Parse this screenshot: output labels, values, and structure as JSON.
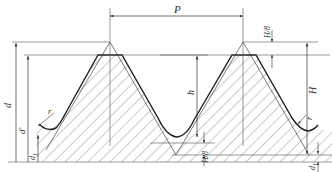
{
  "figure": {
    "type": "thread-profile-drawing",
    "labels": {
      "pitch": "P",
      "major_diameter": "d",
      "diameter_prime": "d'",
      "minor_diameter": "d",
      "minor_diameter_sub": "1",
      "thread_depth": "h",
      "fundamental_height": "H",
      "crest_truncation": "H/8",
      "root_truncation": "H/8",
      "radius_left": "r",
      "radius_right": "r",
      "d1_right": "d",
      "d1_right_sub": "1"
    },
    "colors": {
      "line": "#333333",
      "hatch": "#555555",
      "background": "#ffffff"
    }
  }
}
